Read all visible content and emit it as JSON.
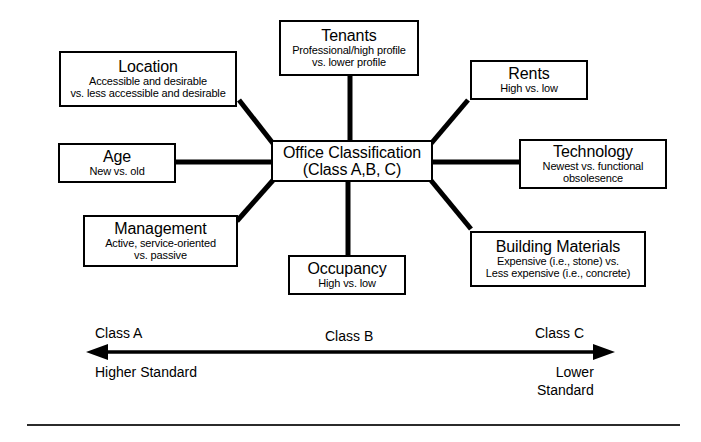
{
  "diagram": {
    "center": {
      "name": "office-classification",
      "title": "Office Classification",
      "sub1": "(Class A,B, C)"
    },
    "nodes": [
      {
        "key": "tenants",
        "title": "Tenants",
        "sub1": "Professional/high profile",
        "sub2": "vs. lower profile"
      },
      {
        "key": "location",
        "title": "Location",
        "sub1": "Accessible and desirable",
        "sub2": "vs. less accessible and desirable"
      },
      {
        "key": "rents",
        "title": "Rents",
        "sub1": "High vs. low",
        "sub2": ""
      },
      {
        "key": "age",
        "title": "Age",
        "sub1": "New vs. old",
        "sub2": ""
      },
      {
        "key": "technology",
        "title": "Technology",
        "sub1": "Newest vs. functional",
        "sub2": "obsolesence"
      },
      {
        "key": "management",
        "title": "Management",
        "sub1": "Active, service-oriented",
        "sub2": "vs. passive"
      },
      {
        "key": "occupancy",
        "title": "Occupancy",
        "sub1": "High vs. low",
        "sub2": ""
      },
      {
        "key": "materials",
        "title": "Building Materials",
        "sub1": "Expensive (i.e., stone) vs.",
        "sub2": "Less expensive (i.e., concrete)"
      }
    ]
  },
  "scale": {
    "class_a": "Class A",
    "class_b": "Class B",
    "class_c": "Class C",
    "left_line1": "Higher",
    "left_line2": "Standard",
    "right_line1": "Lower",
    "right_line2": "Standard"
  },
  "colors": {
    "line": "#000000",
    "rule": "#2b2b2b",
    "background": "#ffffff"
  }
}
